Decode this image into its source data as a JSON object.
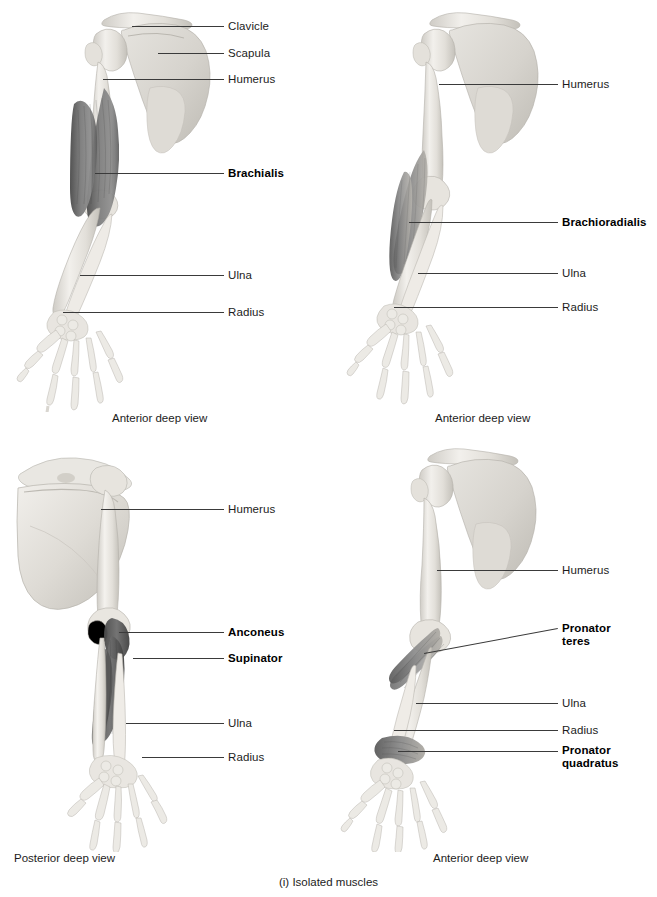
{
  "figure": {
    "caption": "(i) Isolated muscles",
    "background_color": "#ffffff",
    "text_color": "#1c1c1c",
    "leader_color": "#3a3a3a",
    "bone_color": "#e9e7e2",
    "muscle_color": "#6f6f6f"
  },
  "panels": [
    {
      "id": "top-left",
      "view_caption": "Anterior deep view",
      "labels": [
        {
          "text": "Clavicle",
          "bold": false,
          "x": 228,
          "y": 20,
          "leader": {
            "x1": 132,
            "y1": 26,
            "x2": 224,
            "y2": 26
          }
        },
        {
          "text": "Scapula",
          "bold": false,
          "x": 228,
          "y": 47,
          "leader": {
            "x1": 158,
            "y1": 53,
            "x2": 224,
            "y2": 53
          }
        },
        {
          "text": "Humerus",
          "bold": false,
          "x": 228,
          "y": 73,
          "leader": {
            "x1": 103,
            "y1": 79,
            "x2": 224,
            "y2": 79
          }
        },
        {
          "text": "Brachialis",
          "bold": true,
          "x": 228,
          "y": 167,
          "leader": {
            "x1": 95,
            "y1": 173,
            "x2": 224,
            "y2": 173
          }
        },
        {
          "text": "Ulna",
          "bold": false,
          "x": 228,
          "y": 269,
          "leader": {
            "x1": 80,
            "y1": 275,
            "x2": 224,
            "y2": 275
          }
        },
        {
          "text": "Radius",
          "bold": false,
          "x": 228,
          "y": 306,
          "leader": {
            "x1": 63,
            "y1": 312,
            "x2": 224,
            "y2": 312
          }
        }
      ]
    },
    {
      "id": "top-right",
      "view_caption": "Anterior deep view",
      "labels": [
        {
          "text": "Humerus",
          "bold": false,
          "x": 234,
          "y": 78,
          "leader": {
            "x1": 111,
            "y1": 84,
            "x2": 230,
            "y2": 84
          }
        },
        {
          "text": "Brachioradialis",
          "bold": true,
          "x": 234,
          "y": 216,
          "leader": {
            "x1": 81,
            "y1": 222,
            "x2": 230,
            "y2": 222
          }
        },
        {
          "text": "Ulna",
          "bold": false,
          "x": 234,
          "y": 267,
          "leader": {
            "x1": 90,
            "y1": 273,
            "x2": 230,
            "y2": 273
          }
        },
        {
          "text": "Radius",
          "bold": false,
          "x": 234,
          "y": 301,
          "leader": {
            "x1": 66,
            "y1": 307,
            "x2": 230,
            "y2": 307
          }
        }
      ]
    },
    {
      "id": "bottom-left",
      "view_caption": "Posterior deep view",
      "labels": [
        {
          "text": "Humerus",
          "bold": false,
          "x": 228,
          "y": 63,
          "leader": {
            "x1": 101,
            "y1": 69,
            "x2": 224,
            "y2": 69
          }
        },
        {
          "text": "Anconeus",
          "bold": true,
          "x": 228,
          "y": 186,
          "leader": {
            "x1": 119,
            "y1": 192,
            "x2": 224,
            "y2": 192
          }
        },
        {
          "text": "Supinator",
          "bold": true,
          "x": 228,
          "y": 212,
          "leader": {
            "x1": 133,
            "y1": 218,
            "x2": 224,
            "y2": 218
          }
        },
        {
          "text": "Ulna",
          "bold": false,
          "x": 228,
          "y": 277,
          "leader": {
            "x1": 126,
            "y1": 283,
            "x2": 224,
            "y2": 283
          }
        },
        {
          "text": "Radius",
          "bold": false,
          "x": 228,
          "y": 311,
          "leader": {
            "x1": 142,
            "y1": 317,
            "x2": 224,
            "y2": 317
          }
        }
      ]
    },
    {
      "id": "bottom-right",
      "view_caption": "Anterior deep view",
      "labels": [
        {
          "text": "Pronator\nteres",
          "bold": true,
          "x": 234,
          "y": 182,
          "leader": {
            "x1": 96,
            "y1": 213,
            "x2": 230,
            "y2": 188
          }
        },
        {
          "text": "Humerus",
          "bold": false,
          "x": 234,
          "y": 124,
          "leader": {
            "x1": 109,
            "y1": 130,
            "x2": 230,
            "y2": 130
          }
        },
        {
          "text": "Ulna",
          "bold": false,
          "x": 234,
          "y": 257,
          "leader": {
            "x1": 88,
            "y1": 263,
            "x2": 230,
            "y2": 263
          }
        },
        {
          "text": "Radius",
          "bold": false,
          "x": 234,
          "y": 284,
          "leader": {
            "x1": 66,
            "y1": 290,
            "x2": 230,
            "y2": 290
          }
        },
        {
          "text": "Pronator\nquadratus",
          "bold": true,
          "x": 234,
          "y": 304,
          "leader": {
            "x1": 70,
            "y1": 311,
            "x2": 230,
            "y2": 311
          }
        }
      ]
    }
  ]
}
